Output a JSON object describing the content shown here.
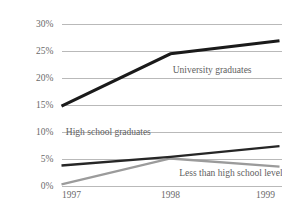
{
  "chart_data": {
    "type": "line",
    "title": "",
    "subtitle": "",
    "xlabel": "",
    "ylabel": "",
    "categories": [
      "1997",
      "1998",
      "1999"
    ],
    "x": [
      1997,
      1998,
      1999
    ],
    "ylim": [
      0,
      30
    ],
    "yticks": [
      0,
      5,
      10,
      15,
      20,
      25,
      30
    ],
    "ytick_labels": [
      "0%",
      "5%",
      "10%",
      "15%",
      "20%",
      "25%",
      "30%"
    ],
    "xtick_labels": [
      "1997",
      "1998",
      "1999"
    ],
    "grid": "horizontal",
    "legend_position": "inline-annotations",
    "series": [
      {
        "name": "University graduates",
        "values": [
          14.7,
          24.4,
          26.8
        ],
        "color": "#1a1a1a",
        "width": 3.1,
        "label_x": 1998.02,
        "label_y": 21.2,
        "label_anchor": "start"
      },
      {
        "name": "High school graduates",
        "values": [
          3.7,
          5.3,
          7.3
        ],
        "color": "#262626",
        "width": 2.3,
        "label_x": 1997.04,
        "label_y": 9.8,
        "label_anchor": "start"
      },
      {
        "name": "Less than high school level",
        "values": [
          0.2,
          5.0,
          3.5
        ],
        "color": "#9b9b9b",
        "width": 2.3,
        "label_x": 1998.08,
        "label_y": 2.1,
        "label_anchor": "start"
      }
    ]
  },
  "colors": {
    "background": "#ffffff",
    "grid": "#b9b9b9",
    "tick_text": "#6a6a6a",
    "annotation_text": "#5e5e5e",
    "series_university": "#1a1a1a",
    "series_highschool": "#262626",
    "series_lessthan": "#9b9b9b"
  }
}
